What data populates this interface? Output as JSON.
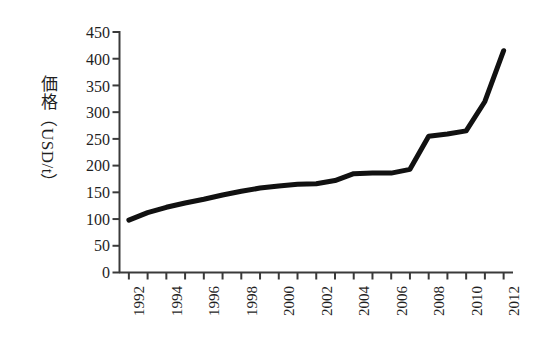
{
  "chart_data": {
    "type": "line",
    "title": "",
    "subtitle": "",
    "xlabel": "",
    "ylabel": "価格（USD/t）",
    "ylabel_parts": {
      "kanji": "価格",
      "paren_open": "（",
      "latin": "USD/t",
      "paren_close": "）"
    },
    "xlim": [
      1991.5,
      2012.5
    ],
    "ylim": [
      0,
      450
    ],
    "grid": false,
    "legend": null,
    "legend_position": "none",
    "y_ticks": [
      0,
      50,
      100,
      150,
      200,
      250,
      300,
      350,
      400,
      450
    ],
    "y_tick_labels": [
      "0",
      "50",
      "100",
      "150",
      "200",
      "250",
      "300",
      "350",
      "400",
      "450"
    ],
    "x_ticks": [
      1992,
      1993,
      1994,
      1995,
      1996,
      1997,
      1998,
      1999,
      2000,
      2001,
      2002,
      2003,
      2004,
      2005,
      2006,
      2007,
      2008,
      2009,
      2010,
      2011,
      2012
    ],
    "x_tick_labels_shown": [
      "1992",
      "1994",
      "1996",
      "1998",
      "2000",
      "2002",
      "2004",
      "2006",
      "2008",
      "2010",
      "2012"
    ],
    "series_color": "#111111",
    "line_width": 5,
    "x": [
      1992,
      1993,
      1994,
      1995,
      1996,
      1997,
      1998,
      1999,
      2000,
      2001,
      2002,
      2003,
      2004,
      2005,
      2006,
      2007,
      2008,
      2009,
      2010,
      2011,
      2012
    ],
    "values": [
      98,
      112,
      122,
      130,
      137,
      145,
      152,
      158,
      162,
      165,
      166,
      172,
      185,
      186,
      186,
      193,
      255,
      259,
      265,
      320,
      415
    ],
    "series": [
      {
        "name": "価格",
        "values": [
          98,
          112,
          122,
          130,
          137,
          145,
          152,
          158,
          162,
          165,
          166,
          172,
          185,
          186,
          186,
          193,
          255,
          259,
          265,
          320,
          415
        ]
      }
    ],
    "annotations": []
  },
  "axes": {
    "y_title": "価格（USD/t）",
    "y_labels": [
      "450",
      "400",
      "350",
      "300",
      "250",
      "200",
      "150",
      "100",
      "50",
      "0"
    ],
    "x_labels": [
      "1992",
      "1994",
      "1996",
      "1998",
      "2000",
      "2002",
      "2004",
      "2006",
      "2008",
      "2010",
      "2012"
    ]
  },
  "colors": {
    "background": "#ffffff",
    "axis": "#3a3a3a",
    "line": "#111111",
    "text": "#1f1f1f"
  }
}
